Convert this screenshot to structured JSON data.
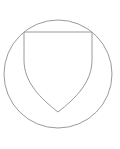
{
  "diagram": {
    "stroke_color": "#9a9a9a",
    "background": "#ffffff",
    "circle": {
      "cx": 58,
      "cy": 74,
      "r": 54
    },
    "shield": {
      "top_left": [
        24,
        32
      ],
      "top_right": [
        92,
        32
      ],
      "tip": [
        58,
        112
      ]
    }
  }
}
